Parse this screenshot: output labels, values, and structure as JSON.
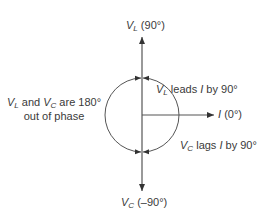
{
  "diagram": {
    "phasors": [
      {
        "id": "vl",
        "symbol": "V",
        "subscript": "L",
        "angle_label": "(90°)",
        "angle_deg": 90
      },
      {
        "id": "i",
        "symbol": "I",
        "subscript": "",
        "angle_label": "(0°)",
        "angle_deg": 0
      },
      {
        "id": "vc",
        "symbol": "V",
        "subscript": "C",
        "angle_label": "(–90°)",
        "angle_deg": -90
      }
    ],
    "annotations": {
      "leads": {
        "symbol": "V",
        "subscript": "L",
        "text_mid": " leads ",
        "ref": "I",
        "text_end": " by 90°"
      },
      "lags": {
        "symbol": "V",
        "subscript": "C",
        "text_mid": " lags ",
        "ref": "I",
        "text_end": " by 90°"
      },
      "phase": {
        "line1_a": "V",
        "line1_a_sub": "L",
        "line1_mid": " and ",
        "line1_b": "V",
        "line1_b_sub": "C",
        "line1_end": " are 180°",
        "line2": "out of phase"
      }
    },
    "colors": {
      "line": "#555555",
      "text": "#3a3a3a"
    }
  }
}
